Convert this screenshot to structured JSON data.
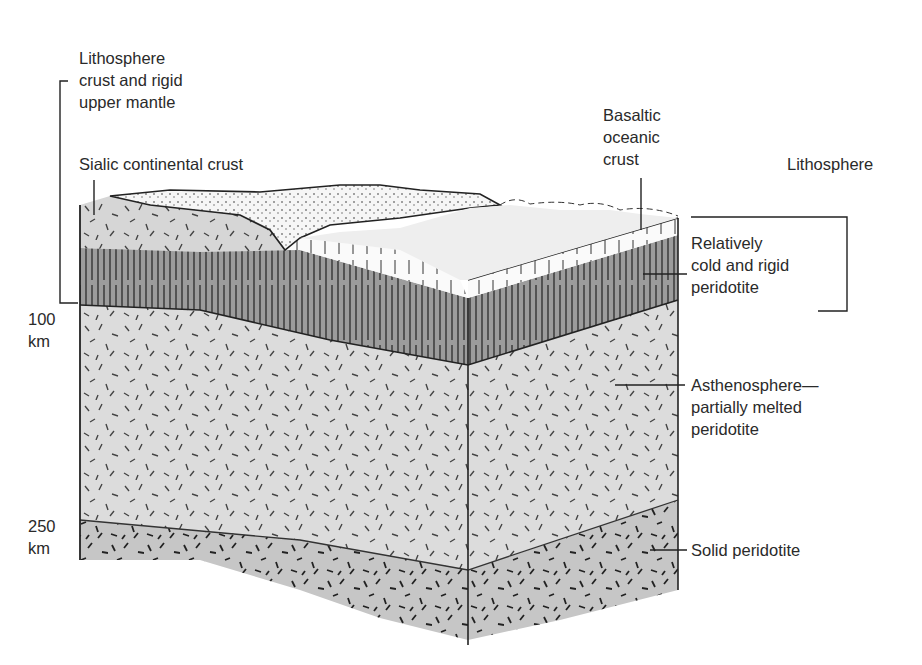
{
  "diagram": {
    "type": "block cross-section of Earth's lithosphere and asthenosphere",
    "labels": {
      "lithosphere_left": [
        "Lithosphere",
        "crust and rigid",
        "upper mantle"
      ],
      "sialic": "Sialic continental crust",
      "basaltic": [
        "Basaltic",
        "oceanic",
        "crust"
      ],
      "lithosphere_right": "Lithosphere",
      "rigid_peridotite": [
        "Relatively",
        "cold and rigid",
        "peridotite"
      ],
      "asthenosphere": [
        "Asthenosphere—",
        "partially melted",
        "peridotite"
      ],
      "solid_peridotite": "Solid peridotite",
      "depth_100": [
        "100",
        "km"
      ],
      "depth_250": [
        "250",
        "km"
      ]
    },
    "layers": [
      {
        "name": "Sialic continental crust",
        "color": "#d8d8d8"
      },
      {
        "name": "Basaltic oceanic crust",
        "color": "#f4f4f4"
      },
      {
        "name": "Relatively cold and rigid peridotite",
        "color": "#9a9a9a"
      },
      {
        "name": "Asthenosphere",
        "color": "#dcdcdc"
      },
      {
        "name": "Solid peridotite",
        "color": "#c4c4c4"
      }
    ]
  }
}
